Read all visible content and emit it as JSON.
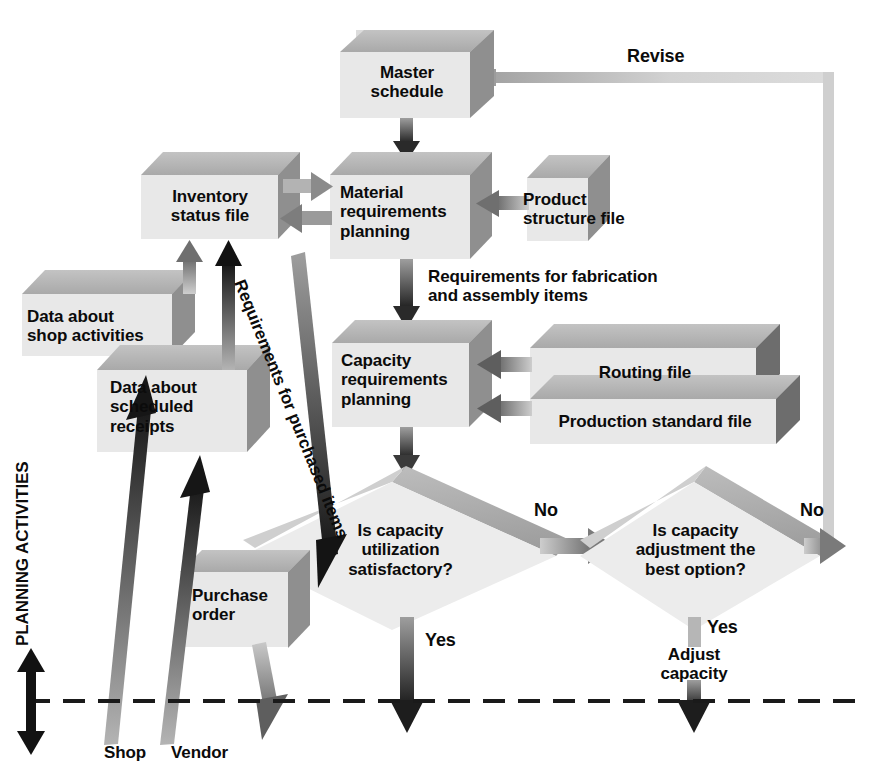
{
  "diagram": {
    "axis_label": "PLANNING ACTIVITIES",
    "boxes": {
      "master_schedule": "Master\nschedule",
      "inventory_status_file": "Inventory\nstatus file",
      "material_requirements_planning": "Material\nrequirements\nplanning",
      "product_structure_file": "Product\nstructure file",
      "data_about_shop_activities": "Data about\nshop activities",
      "data_about_scheduled_receipts": "Data about\nscheduled\nreceipts",
      "capacity_requirements_planning": "Capacity\nrequirements\nplanning",
      "routing_file": "Routing file",
      "production_standard_file": "Production standard file",
      "purchase_order": "Purchase\norder"
    },
    "decisions": {
      "capacity_utilization": "Is capacity\nutilization\nsatisfactory?",
      "capacity_adjustment": "Is capacity\nadjustment the\nbest option?"
    },
    "edge_labels": {
      "revise": "Revise",
      "requirements_fabrication": "Requirements for fabrication\nand assembly items",
      "requirements_purchased": "Requirements for purchased items",
      "no_first": "No",
      "no_second": "No",
      "yes_first": "Yes",
      "yes_second": "Yes",
      "adjust_capacity": "Adjust\ncapacity",
      "shop": "Shop",
      "vendor": "Vendor"
    },
    "colors": {
      "box_front": "#e6e6e6",
      "box_top": "#b4b4b4",
      "box_side": "#949494",
      "diamond_front": "#ececec",
      "diamond_top": "#b0b0b0",
      "arrow_dark": "#1a1a1a",
      "arrow_gray": "#8d8d8d",
      "arrow_light": "#c9c9c9",
      "text": "#0b0b0b",
      "dash_line": "#1a1a1a"
    }
  }
}
